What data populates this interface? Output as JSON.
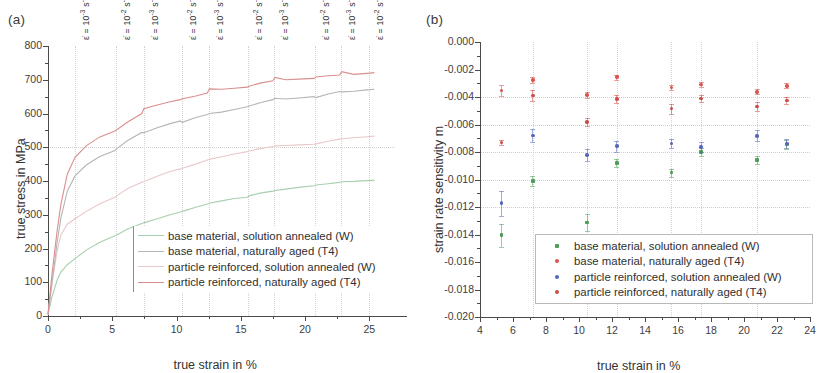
{
  "figure": {
    "panel_a_label": "(a)",
    "panel_b_label": "(b)"
  },
  "panel_a": {
    "xlabel": "true strain in %",
    "ylabel": "true stress in MPa",
    "xticks": [
      "0",
      "5",
      "10",
      "15",
      "20",
      "25"
    ],
    "yticks": [
      "0",
      "100",
      "200",
      "300",
      "400",
      "500",
      "600",
      "700",
      "800"
    ],
    "rate_annotations": [
      {
        "text": "ε̇ = 10",
        "exp": "-3",
        "unit": " s",
        "unit_exp": "-1",
        "x": 2.1
      },
      {
        "text": "ε̇ = 10",
        "exp": "-2",
        "unit": " s",
        "unit_exp": "-1",
        "x": 5.3
      },
      {
        "text": "ε̇ = 10",
        "exp": "-3",
        "unit": " s",
        "unit_exp": "-1",
        "x": 7.5
      },
      {
        "text": "ε̇ = 10",
        "exp": "-2",
        "unit": " s",
        "unit_exp": "-1",
        "x": 10.4
      },
      {
        "text": "ε̇ = 10",
        "exp": "-3",
        "unit": " s",
        "unit_exp": "-1",
        "x": 12.5
      },
      {
        "text": "ε̇ = 10",
        "exp": "-2",
        "unit": " s",
        "unit_exp": "-1",
        "x": 15.6
      },
      {
        "text": "ε̇ = 10",
        "exp": "-3",
        "unit": " s",
        "unit_exp": "-1",
        "x": 17.6
      },
      {
        "text": "ε̇ = 10",
        "exp": "-2",
        "unit": " s",
        "unit_exp": "-1",
        "x": 20.8
      },
      {
        "text": "ε̇ = 10",
        "exp": "-3",
        "unit": " s",
        "unit_exp": "-1",
        "x": 22.8
      },
      {
        "text": "ε̇ = 10",
        "exp": "-2",
        "unit": " s",
        "unit_exp": "-1",
        "x": 25.0
      }
    ],
    "legend": [
      {
        "label": "base material, solution annealed (W)",
        "color": "#a8cfae"
      },
      {
        "label": "base material, naturally aged (T4)",
        "color": "#b5b5b5"
      },
      {
        "label": "particle reinforced, solution annealed (W)",
        "color": "#e8c9c9"
      },
      {
        "label": "particle reinforced, naturally aged (T4)",
        "color": "#d98f8f"
      }
    ]
  },
  "panel_b": {
    "xlabel": "true strain in %",
    "ylabel": "strain rate sensitivity m",
    "xticks": [
      "4",
      "6",
      "8",
      "10",
      "12",
      "14",
      "16",
      "18",
      "20",
      "22",
      "24"
    ],
    "yticks": [
      "0.000",
      "-0.002",
      "-0.004",
      "-0.006",
      "-0.008",
      "-0.010",
      "-0.012",
      "-0.014",
      "-0.016",
      "-0.018",
      "-0.020"
    ],
    "legend": [
      {
        "label": "base material, solution annealed (W)",
        "color": "#4f9e58"
      },
      {
        "label": "base material, naturally aged (T4)",
        "color": "#d9534f"
      },
      {
        "label": "particle reinforced, solution annealed (W)",
        "color": "#5566bb"
      },
      {
        "label": "particle reinforced, naturally aged (T4)",
        "color": "#cc4b45"
      }
    ]
  },
  "chart_data": [
    {
      "type": "line",
      "panel": "(a)",
      "title": "",
      "xlabel": "true strain in %",
      "ylabel": "true stress in MPa",
      "xlim": [
        0,
        27
      ],
      "ylim": [
        0,
        800
      ],
      "grid": true,
      "legend_position": "inside-bottom-right",
      "annotations": [
        "ε̇ = 10⁻³ s⁻¹",
        "ε̇ = 10⁻² s⁻¹",
        "ε̇ = 10⁻³ s⁻¹",
        "ε̇ = 10⁻² s⁻¹",
        "ε̇ = 10⁻³ s⁻¹",
        "ε̇ = 10⁻² s⁻¹",
        "ε̇ = 10⁻³ s⁻¹",
        "ε̇ = 10⁻² s⁻¹",
        "ε̇ = 10⁻³ s⁻¹",
        "ε̇ = 10⁻² s⁻¹"
      ],
      "series": [
        {
          "name": "particle reinforced, naturally aged (T4)",
          "color": "#d98f8f",
          "x": [
            0,
            0.3,
            0.7,
            1.0,
            1.5,
            2.1,
            3.0,
            4.0,
            5.2,
            5.35,
            6.2,
            7.3,
            7.45,
            8.5,
            9.5,
            10.3,
            10.45,
            11.5,
            12.4,
            12.55,
            13.5,
            14.5,
            15.5,
            15.65,
            16.5,
            17.5,
            17.65,
            18.5,
            19.5,
            20.7,
            20.85,
            21.8,
            22.7,
            22.85,
            23.8,
            24.8,
            25.4
          ],
          "y": [
            5,
            120,
            250,
            330,
            420,
            470,
            505,
            530,
            548,
            552,
            575,
            600,
            614,
            625,
            635,
            641,
            644,
            652,
            661,
            673,
            672,
            675,
            678,
            681,
            690,
            697,
            707,
            700,
            702,
            704,
            708,
            712,
            714,
            724,
            716,
            719,
            721
          ]
        },
        {
          "name": "base material, naturally aged (T4)",
          "color": "#b5b5b5",
          "x": [
            0,
            0.3,
            0.7,
            1.0,
            1.5,
            2.1,
            3.0,
            4.0,
            5.2,
            5.35,
            6.2,
            7.3,
            7.45,
            8.5,
            9.5,
            10.3,
            10.45,
            11.5,
            12.4,
            12.55,
            13.5,
            14.5,
            15.5,
            15.65,
            16.5,
            17.5,
            17.65,
            18.5,
            19.5,
            20.7,
            20.85,
            21.8,
            22.7,
            22.85,
            23.8,
            24.8,
            25.4
          ],
          "y": [
            5,
            95,
            215,
            290,
            370,
            415,
            448,
            472,
            490,
            496,
            520,
            544,
            543,
            558,
            570,
            578,
            574,
            588,
            597,
            600,
            604,
            612,
            620,
            622,
            632,
            641,
            645,
            643,
            646,
            650,
            647,
            658,
            665,
            664,
            666,
            670,
            672
          ]
        },
        {
          "name": "particle reinforced, solution annealed (W)",
          "color": "#e8c9c9",
          "x": [
            0,
            0.3,
            0.7,
            1.0,
            1.5,
            2.1,
            3.0,
            4.0,
            5.2,
            5.35,
            6.2,
            7.3,
            7.45,
            8.5,
            9.5,
            10.3,
            10.45,
            11.5,
            12.4,
            12.55,
            13.5,
            14.5,
            15.5,
            15.65,
            16.5,
            17.5,
            17.65,
            18.5,
            19.5,
            20.7,
            20.85,
            21.8,
            22.7,
            22.85,
            23.8,
            24.8,
            25.4
          ],
          "y": [
            5,
            95,
            190,
            240,
            272,
            288,
            310,
            332,
            352,
            356,
            378,
            396,
            398,
            414,
            428,
            436,
            438,
            450,
            462,
            464,
            472,
            480,
            487,
            489,
            496,
            502,
            504,
            505,
            507,
            509,
            510,
            518,
            524,
            525,
            528,
            531,
            533
          ]
        },
        {
          "name": "base material, solution annealed (W)",
          "color": "#a8cfae",
          "x": [
            0,
            0.3,
            0.7,
            1.0,
            1.5,
            2.1,
            3.0,
            4.0,
            5.2,
            5.35,
            6.2,
            7.3,
            7.45,
            8.5,
            9.5,
            10.3,
            10.45,
            11.5,
            12.4,
            12.55,
            13.5,
            14.5,
            15.5,
            15.65,
            16.5,
            17.5,
            17.65,
            18.5,
            19.5,
            20.7,
            20.85,
            21.8,
            22.7,
            22.85,
            23.8,
            24.8,
            25.4
          ],
          "y": [
            3,
            55,
            105,
            130,
            152,
            170,
            196,
            218,
            238,
            240,
            258,
            274,
            276,
            288,
            300,
            308,
            310,
            322,
            332,
            334,
            341,
            348,
            352,
            356,
            364,
            370,
            372,
            376,
            381,
            386,
            388,
            392,
            396,
            398,
            399,
            401,
            402
          ]
        }
      ]
    },
    {
      "type": "scatter",
      "panel": "(b)",
      "title": "",
      "xlabel": "true strain in %",
      "ylabel": "strain rate sensitivity m",
      "xlim": [
        4,
        24
      ],
      "ylim": [
        -0.02,
        0.0
      ],
      "grid": true,
      "legend_position": "inside-bottom-right",
      "series": [
        {
          "name": "base material, solution annealed (W)",
          "color": "#4f9e58",
          "marker": "square",
          "x": [
            5.3,
            7.2,
            10.5,
            12.3,
            15.6,
            17.4,
            20.8,
            22.6
          ],
          "y": [
            -0.01405,
            -0.0101,
            -0.01312,
            -0.00882,
            -0.0095,
            -0.008,
            -0.0086,
            -0.00745
          ],
          "yerr": [
            0.00085,
            0.00035,
            0.0006,
            0.0003,
            0.0003,
            0.0003,
            0.0003,
            0.0003
          ]
        },
        {
          "name": "base material, naturally aged (T4)",
          "color": "#d9534f",
          "marker": "circle",
          "x": [
            5.3,
            7.2,
            10.5,
            12.3,
            15.6,
            17.4,
            20.8,
            22.6
          ],
          "y": [
            -0.00352,
            -0.00278,
            -0.00385,
            -0.00255,
            -0.0033,
            -0.00308,
            -0.00362,
            -0.00318
          ],
          "yerr": [
            0.00042,
            0.00022,
            0.0002,
            0.00018,
            0.0002,
            0.00018,
            0.00018,
            0.00018
          ]
        },
        {
          "name": "particle reinforced, solution annealed (W)",
          "color": "#5566bb",
          "marker": "circle",
          "x": [
            5.3,
            7.2,
            10.5,
            12.3,
            15.6,
            17.4,
            20.8,
            22.6
          ],
          "y": [
            -0.01172,
            -0.0068,
            -0.0082,
            -0.00758,
            -0.00738,
            -0.00765,
            -0.00682,
            -0.00738
          ],
          "yerr": [
            0.0009,
            0.00045,
            0.00045,
            0.0004,
            0.00035,
            0.00035,
            0.0004,
            0.00035
          ]
        },
        {
          "name": "particle reinforced, naturally aged (T4)",
          "color": "#cc4b45",
          "marker": "circle",
          "x": [
            5.3,
            7.2,
            10.5,
            12.3,
            15.6,
            17.4,
            20.8,
            22.6
          ],
          "y": [
            -0.00732,
            -0.0039,
            -0.0058,
            -0.00415,
            -0.00485,
            -0.00412,
            -0.0047,
            -0.00425
          ],
          "yerr": [
            0.0002,
            0.00042,
            0.0003,
            0.00032,
            0.00035,
            0.00025,
            0.00035,
            0.00025
          ]
        }
      ]
    }
  ]
}
